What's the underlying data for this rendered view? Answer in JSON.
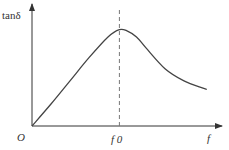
{
  "chart_data": {
    "type": "line",
    "title": "",
    "ylabel": "tanδ",
    "xlabel": "f",
    "origin_label": "O",
    "peak_label": "f 0",
    "annotations": [
      "Dashed vertical line at peak f0"
    ],
    "xlim": [
      0,
      1
    ],
    "ylim": [
      0,
      1
    ],
    "grid": false,
    "series": [
      {
        "name": "tanδ(f)",
        "x": [
          0,
          0.1,
          0.2,
          0.3,
          0.4,
          0.46,
          0.5,
          0.55,
          0.6,
          0.7,
          0.8,
          0.9,
          0.92
        ],
        "y": [
          0,
          0.18,
          0.37,
          0.56,
          0.73,
          0.79,
          0.78,
          0.73,
          0.64,
          0.47,
          0.37,
          0.31,
          0.3
        ]
      }
    ],
    "peak_x": 0.46
  },
  "colors": {
    "axis": "#333333",
    "curve": "#444444",
    "dash": "#777777"
  }
}
